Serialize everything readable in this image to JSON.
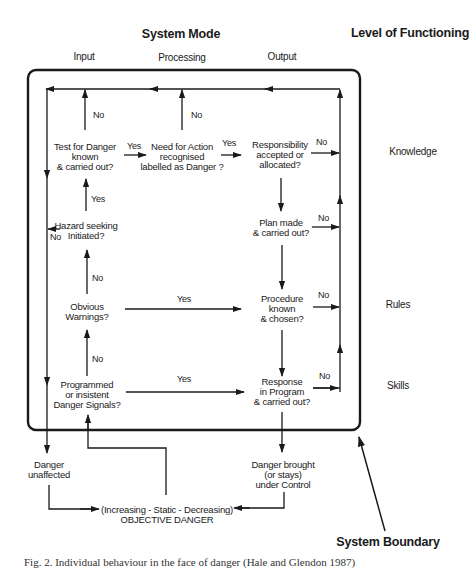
{
  "header": {
    "system_mode": "System Mode",
    "level_of_functioning": "Level of Functioning"
  },
  "columns": {
    "input": "Input",
    "processing": "Processing",
    "output": "Output"
  },
  "levels": {
    "knowledge": "Knowledge",
    "rules": "Rules",
    "skills": "Skills"
  },
  "nodes": {
    "test_for_danger": [
      "Test for Danger",
      "known",
      "& carried out?"
    ],
    "need_for_action": [
      "Need for Action",
      "recognised",
      "labelled as Danger ?"
    ],
    "responsibility": [
      "Responsibility",
      "accepted or",
      "allocated?"
    ],
    "hazard_seeking": [
      "Hazard seeking",
      "Initiated?"
    ],
    "plan_made": [
      "Plan made",
      "& carried out?"
    ],
    "obvious_warnings": [
      "Obvious",
      "Warnings?"
    ],
    "procedure_known": [
      "Procedure",
      "known",
      "& chosen?"
    ],
    "programmed_signals": [
      "Programmed",
      "or insistent",
      "Danger Signals?"
    ],
    "response_in_program": [
      "Response",
      "in Program",
      "& carried out?"
    ],
    "danger_unaffected": [
      "Danger",
      "unaffected"
    ],
    "danger_controlled": [
      "Danger brought",
      "(or stays)",
      "under Control"
    ],
    "objective_danger": [
      "(Increasing - Static - Decreasing)",
      "OBJECTIVE DANGER"
    ]
  },
  "edge_labels": {
    "test_no": "No",
    "need_no": "No",
    "test_to_need_yes": "Yes",
    "need_to_resp_yes": "Yes",
    "resp_no": "No",
    "hazard_to_test_yes": "Yes",
    "hazard_no": "No",
    "plan_no": "No",
    "obvious_to_hazard_no": "No",
    "obvious_to_proc_yes": "Yes",
    "proc_no": "No",
    "programmed_to_obvious_no": "No",
    "programmed_to_response_yes": "Yes",
    "response_no": "No"
  },
  "system_boundary_label": "System Boundary",
  "caption": "Fig. 2. Individual behaviour in the face of danger (Hale and Glendon 1987)"
}
